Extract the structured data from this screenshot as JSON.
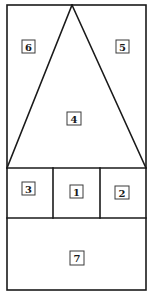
{
  "diagram": {
    "type": "partitioned-rectangle",
    "stroke_color": "#1a1a1a",
    "background_color": "#ffffff",
    "regions": [
      {
        "id": "region-1",
        "label": "1",
        "position": "middle-center"
      },
      {
        "id": "region-2",
        "label": "2",
        "position": "middle-right"
      },
      {
        "id": "region-3",
        "label": "3",
        "position": "middle-left"
      },
      {
        "id": "region-4",
        "label": "4",
        "position": "top-triangle"
      },
      {
        "id": "region-5",
        "label": "5",
        "position": "top-right"
      },
      {
        "id": "region-6",
        "label": "6",
        "position": "top-left"
      },
      {
        "id": "region-7",
        "label": "7",
        "position": "bottom"
      }
    ]
  }
}
